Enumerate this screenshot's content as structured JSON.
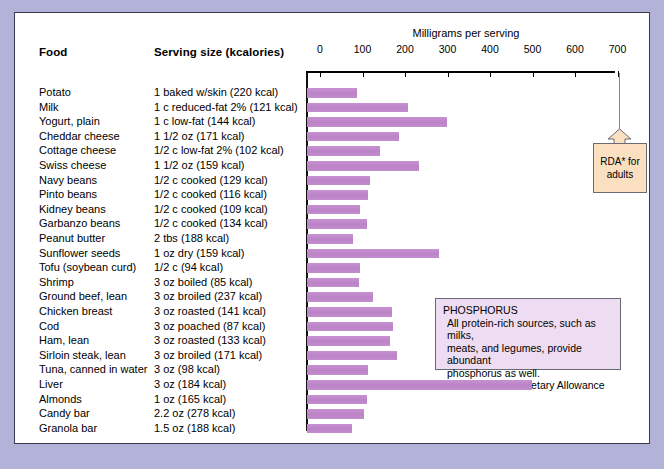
{
  "figure": {
    "axis_title": "Milligrams per serving",
    "headers": {
      "food": "Food",
      "serving": "Serving size (kcalories)"
    },
    "colors": {
      "bar": "#c08ccb",
      "page_background": "#b3b3d9",
      "panel_background": "#ffffff",
      "rda_box": "#fae0c0",
      "info_box": "#eeddf2"
    }
  },
  "rda_callout": {
    "label_line1": "RDA* for",
    "label_line2": "adults",
    "value": 700
  },
  "info_callout": {
    "title": "PHOSPHORUS",
    "body_line1": "All protein-rich sources, such as milks,",
    "body_line2": "meats, and legumes, provide abundant",
    "body_line3": "phosphorus as well.",
    "note": "*Recommended Dietary Allowance"
  },
  "chart_data": {
    "type": "bar",
    "title": "Milligrams per serving",
    "xlabel": "Milligrams per serving",
    "ylabel": "Food",
    "orientation": "horizontal",
    "xlim": [
      0,
      700
    ],
    "grid": false,
    "tick_labels": [
      "0",
      "100",
      "200",
      "300",
      "400",
      "500",
      "600",
      "700"
    ],
    "ticks": [
      0,
      100,
      200,
      300,
      400,
      500,
      600,
      700
    ],
    "reference_line": {
      "label": "RDA* for adults",
      "value": 700
    },
    "categories": [
      "Potato",
      "Milk",
      "Yogurt, plain",
      "Cheddar cheese",
      "Cottage cheese",
      "Swiss cheese",
      "Navy beans",
      "Pinto beans",
      "Kidney beans",
      "Garbanzo beans",
      "Peanut butter",
      "Sunflower seeds",
      "Tofu (soybean curd)",
      "Shrimp",
      "Ground beef, lean",
      "Chicken breast",
      "Cod",
      "Ham, lean",
      "Sirloin steak, lean",
      "Tuna, canned in water",
      "Liver",
      "Almonds",
      "Candy bar",
      "Granola bar"
    ],
    "serving_sizes": [
      "1 baked w/skin (220 kcal)",
      "1 c reduced-fat 2% (121 kcal)",
      "1 c low-fat (144 kcal)",
      "1 1/2 oz (171 kcal)",
      "1/2 c low-fat 2% (102 kcal)",
      "1 1/2 oz (159 kcal)",
      "1/2 c cooked (129 kcal)",
      "1/2 c cooked (116 kcal)",
      "1/2 c cooked (109 kcal)",
      "1/2 c cooked (134 kcal)",
      "2 tbs (188 kcal)",
      "1 oz dry (159 kcal)",
      "1/2 c (94 kcal)",
      "3 oz boiled (85 kcal)",
      "3 oz broiled (237 kcal)",
      "3 oz roasted (141 kcal)",
      "3 oz poached (87 kcal)",
      "3 oz roasted (133 kcal)",
      "3 oz broiled (171 kcal)",
      "3 oz (98 kcal)",
      "3 oz (184 kcal)",
      "1 oz (165 kcal)",
      "2.2 oz (278 kcal)",
      "1.5 oz (188 kcal)"
    ],
    "values": [
      118,
      238,
      329,
      217,
      172,
      264,
      148,
      144,
      125,
      141,
      108,
      311,
      125,
      123,
      155,
      200,
      202,
      195,
      212,
      144,
      529,
      141,
      134,
      106
    ]
  }
}
